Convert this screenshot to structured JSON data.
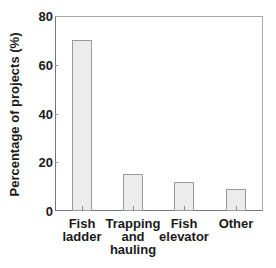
{
  "chart_data": {
    "type": "bar",
    "title": "",
    "xlabel": "",
    "ylabel": "Percentage of projects (%)",
    "ylim": [
      0,
      80
    ],
    "yticks": [
      0,
      20,
      40,
      60,
      80
    ],
    "grid": false,
    "legend": null,
    "categories": [
      "Fish ladder",
      "Trapping and hauling",
      "Fish elevator",
      "Other"
    ],
    "values": [
      70,
      15,
      12,
      9
    ],
    "bar_color": "#ececec",
    "bar_edge_color": "#9a9a9a"
  },
  "labels": {
    "ylabel": "Percentage of projects (%)",
    "yticks": [
      "0",
      "20",
      "40",
      "60",
      "80"
    ],
    "categories": [
      "Fish\nladder",
      "Trapping\nand\nhauling",
      "Fish\nelevator",
      "Other"
    ]
  }
}
